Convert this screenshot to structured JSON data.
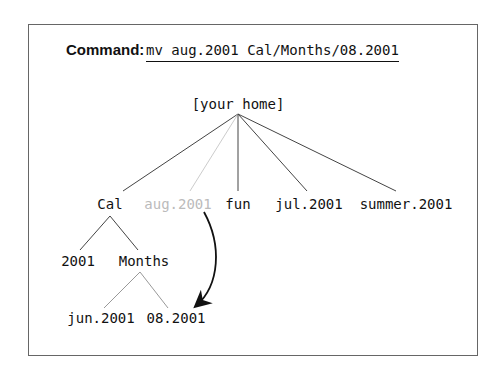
{
  "command": {
    "label": "Command:",
    "text": "mv aug.2001 Cal/Months/08.2001"
  },
  "tree": {
    "root": "[your home]",
    "level1": [
      "Cal",
      "aug.2001",
      "fun",
      "jul.2001",
      "summer.2001"
    ],
    "cal_children": [
      "2001",
      "Months"
    ],
    "months_children": [
      "jun.2001",
      "08.2001"
    ]
  },
  "colors": {
    "line": "#444444",
    "moved_item": "#bbbbbb",
    "border": "#666666"
  }
}
